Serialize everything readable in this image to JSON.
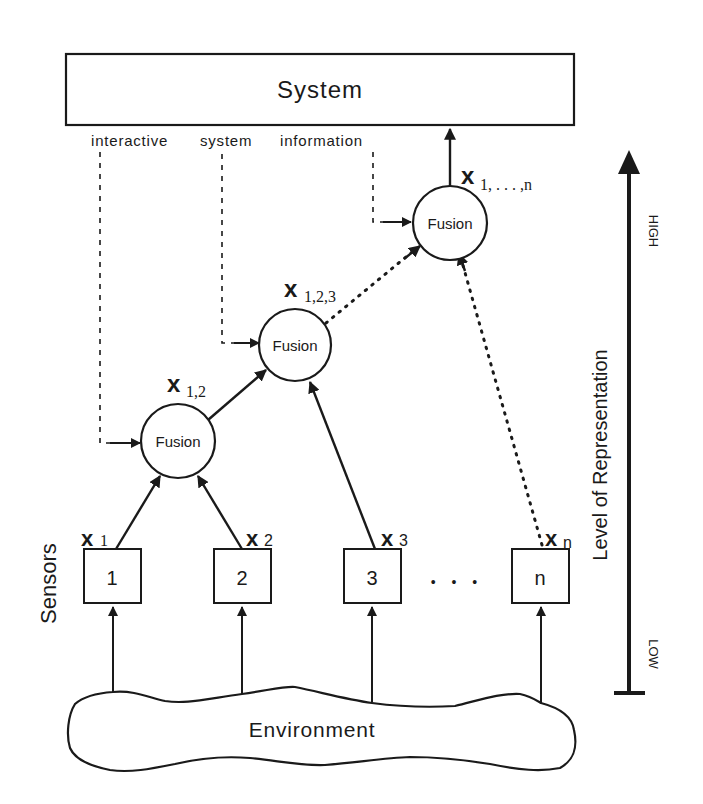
{
  "diagram": {
    "type": "multisensor-fusion-hierarchy",
    "colors": {
      "ink": "#1a1a1a",
      "background": "#ffffff"
    },
    "system": {
      "label": "System"
    },
    "feedback_label": {
      "word1": "interactive",
      "word2": "system",
      "word3": "information"
    },
    "fusion_nodes": [
      {
        "id": "fusion-1",
        "label": "Fusion",
        "output_var": "x",
        "output_sub": "1,2"
      },
      {
        "id": "fusion-2",
        "label": "Fusion",
        "output_var": "x",
        "output_sub": "1,2,3"
      },
      {
        "id": "fusion-3",
        "label": "Fusion",
        "output_var": "x",
        "output_sub": "1, . . . ,n"
      }
    ],
    "sensors": {
      "group_label": "Sensors",
      "items": [
        {
          "label": "1",
          "output_var": "x",
          "output_sub": "1"
        },
        {
          "label": "2",
          "output_var": "x",
          "output_sub": "2"
        },
        {
          "label": "3",
          "output_var": "x",
          "output_sub": "3"
        },
        {
          "label": "n",
          "output_var": "x",
          "output_sub": "n"
        }
      ],
      "ellipsis": "• • •"
    },
    "environment": {
      "label": "Environment"
    },
    "axis": {
      "label": "Level of Representation",
      "high": "HIGH",
      "low": "LOW"
    }
  }
}
